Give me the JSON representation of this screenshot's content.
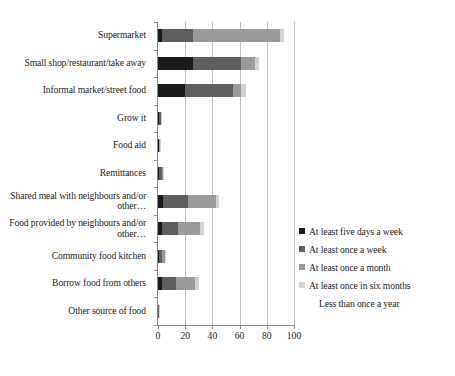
{
  "chart_data": {
    "type": "bar",
    "orientation": "horizontal",
    "stacked": true,
    "title": "",
    "xlabel": "",
    "ylabel": "",
    "xlim": [
      0,
      100
    ],
    "xticks": [
      0,
      20,
      40,
      60,
      80,
      100
    ],
    "grid": true,
    "legend_position": "right",
    "categories": [
      "Supermarket",
      "Small shop/restaurant/take away",
      "Informal market/street food",
      "Grow it",
      "Food aid",
      "Remittances",
      "Shared meal with neighbours and/or other…",
      "Food provided by neighbours and/or other…",
      "Community food kitchen",
      "Borrow food from others",
      "Other source of food"
    ],
    "series": [
      {
        "name": "At least five days a week",
        "color": "#1a1a1a",
        "values": [
          3,
          26,
          20,
          1,
          0.5,
          1,
          4,
          3,
          1,
          3,
          0.3
        ]
      },
      {
        "name": "At least once a week",
        "color": "#5e5e5e",
        "values": [
          23,
          35,
          35,
          1,
          0.5,
          2,
          18,
          12,
          2,
          10,
          0.2
        ]
      },
      {
        "name": "At least once a month",
        "color": "#9a9a9a",
        "values": [
          64,
          10,
          6,
          0.5,
          0.3,
          1,
          21,
          16,
          2,
          14,
          0.1
        ]
      },
      {
        "name": "At least once in six months",
        "color": "#d2d2d2",
        "values": [
          3,
          3,
          4,
          0.5,
          0.2,
          0.5,
          2,
          3,
          1,
          3,
          0.1
        ]
      },
      {
        "name": "Less than once a year",
        "color": "#f2f2f2",
        "values": [
          0,
          0,
          0,
          0,
          0,
          0,
          0,
          0,
          0,
          0,
          0
        ]
      }
    ]
  },
  "axis": {
    "xticks": [
      "0",
      "20",
      "40",
      "60",
      "80",
      "100"
    ]
  },
  "legend": {
    "items": [
      {
        "label": "At least five days a week",
        "color": "#1a1a1a"
      },
      {
        "label": "At least once a week",
        "color": "#5e5e5e"
      },
      {
        "label": "At least once a month",
        "color": "#9a9a9a"
      },
      {
        "label": "At least once in six months",
        "color": "#d2d2d2"
      },
      {
        "label": "Less than once a year",
        "color": "#ffffff"
      }
    ]
  }
}
